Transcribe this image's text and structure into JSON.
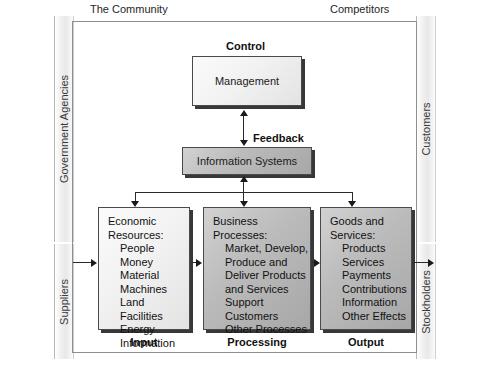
{
  "diagram": {
    "environment": {
      "top_left_label": "The Community",
      "top_right_label": "Competitors",
      "left_upper_label": "Government Agencies",
      "left_lower_label": "Suppliers",
      "right_upper_label": "Customers",
      "right_lower_label": "Stockholders"
    },
    "headers": {
      "control": "Control",
      "feedback": "Feedback"
    },
    "control_box": {
      "label": "Management"
    },
    "information_systems_box": {
      "label": "Information Systems"
    },
    "stages": [
      {
        "caption": "Input",
        "heading": [
          "Economic",
          "Resources:"
        ],
        "items": [
          "People",
          "Money",
          "Material",
          "Machines",
          "Land",
          "Facilities",
          "Energy",
          "Information"
        ]
      },
      {
        "caption": "Processing",
        "heading": [
          "Business",
          "Processes:"
        ],
        "items": [
          "Market, Develop,",
          "Produce and",
          "Deliver Products",
          "and Services",
          "Support Customers",
          "Other Processes"
        ]
      },
      {
        "caption": "Output",
        "heading": [
          "Goods and",
          "Services:"
        ],
        "items": [
          "Products",
          "Services",
          "Payments",
          "Contributions",
          "Information",
          "Other Effects"
        ]
      }
    ],
    "colors": {
      "frame": "#8e8e8e",
      "box_border": "#4a4a4a",
      "connector": "#2a2a2a",
      "text": "#1a1a1a"
    }
  }
}
